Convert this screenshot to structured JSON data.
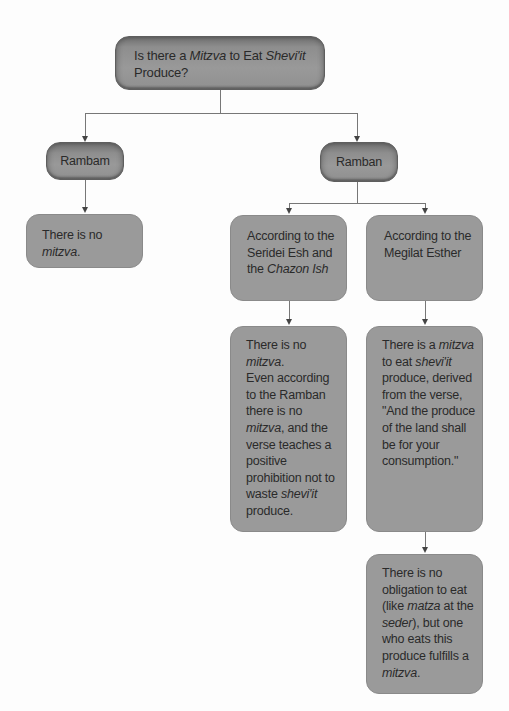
{
  "diagram": {
    "type": "flowchart-tree",
    "root": {
      "id": "root",
      "parts": [
        {
          "text": "Is there a "
        },
        {
          "text": "Mitzva",
          "italic": true
        },
        {
          "text": " to Eat "
        },
        {
          "text": "Shevi'it",
          "italic": true
        },
        {
          "text": " Produce?"
        }
      ]
    },
    "nodes": {
      "rambam": {
        "parts": [
          {
            "text": "Rambam"
          }
        ]
      },
      "ramban": {
        "parts": [
          {
            "text": "Ramban"
          }
        ]
      },
      "rambam_result": {
        "parts": [
          {
            "text": "There is no "
          },
          {
            "text": "mitzva",
            "italic": true
          },
          {
            "text": "."
          }
        ]
      },
      "seridei": {
        "parts": [
          {
            "text": "According to the Seridei Esh and the "
          },
          {
            "text": "Chazon Ish",
            "italic": true
          }
        ]
      },
      "megilat": {
        "parts": [
          {
            "text": "According to the Megilat Esther"
          }
        ]
      },
      "seridei_result": {
        "parts": [
          {
            "text": "There is no "
          },
          {
            "text": "mitzva",
            "italic": true
          },
          {
            "text": ".",
            "break_after": true
          },
          {
            "text": "Even according to the Ramban there is no "
          },
          {
            "text": "mitzva",
            "italic": true
          },
          {
            "text": ", and the verse teaches a positive prohibition not to waste "
          },
          {
            "text": "shevi'it",
            "italic": true
          },
          {
            "text": " produce."
          }
        ]
      },
      "megilat_result": {
        "parts": [
          {
            "text": "There is a "
          },
          {
            "text": "mitzva",
            "italic": true
          },
          {
            "text": " to eat "
          },
          {
            "text": "shevi'it",
            "italic": true
          },
          {
            "text": " produce, derived from the verse, \"And the produce of the land shall be for your consumption.\""
          }
        ]
      },
      "final_result": {
        "parts": [
          {
            "text": "There is no obligation to eat (like "
          },
          {
            "text": "matza",
            "italic": true
          },
          {
            "text": " at the "
          },
          {
            "text": "seder",
            "italic": true
          },
          {
            "text": "), but one who eats this produce fulfills a "
          },
          {
            "text": "mitzva",
            "italic": true
          },
          {
            "text": "."
          }
        ]
      }
    },
    "edges": [
      {
        "from": "root",
        "to": "rambam"
      },
      {
        "from": "root",
        "to": "ramban"
      },
      {
        "from": "rambam",
        "to": "rambam_result"
      },
      {
        "from": "ramban",
        "to": "seridei"
      },
      {
        "from": "ramban",
        "to": "megilat"
      },
      {
        "from": "seridei",
        "to": "seridei_result"
      },
      {
        "from": "megilat",
        "to": "megilat_result"
      },
      {
        "from": "megilat_result",
        "to": "final_result"
      }
    ]
  },
  "colors": {
    "box_fill": "#9a9a9a",
    "header_box_fill": "#8e8e8e",
    "connector": "#777777",
    "background": "#fdfdfd",
    "text": "#2a2a2a"
  }
}
